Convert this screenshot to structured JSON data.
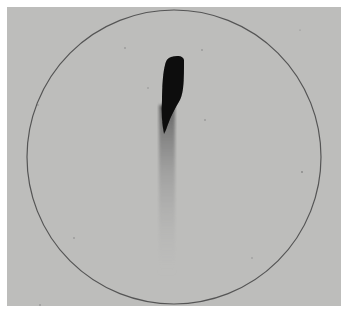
{
  "image": {
    "description": "Grayscale photograph of a circular plate with a single dark elongated spot and a faint downward streak",
    "background_color": "#ffffff",
    "plate_color": "#bdbdbb",
    "circle": {
      "cx": 174,
      "cy": 157,
      "r": 147,
      "stroke": "#555555"
    },
    "spot": {
      "color": "#0a0a0a",
      "streak_color": "#8a8a8a"
    }
  }
}
